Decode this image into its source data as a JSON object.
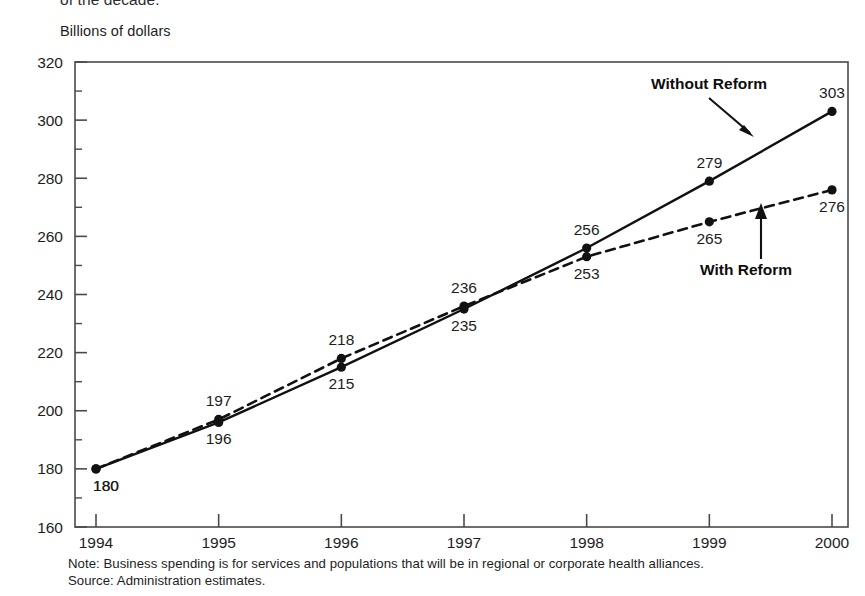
{
  "page": {
    "truncated_heading": "of the decade.",
    "axis_title": "Billions of dollars"
  },
  "footnotes": {
    "note": "Note: Business spending is for services and populations that will be in regional or corporate health alliances.",
    "source": "Source: Administration estimates."
  },
  "annotations": {
    "without_reform_label": "Without Reform",
    "with_reform_label": "With Reform"
  },
  "chart_data": {
    "type": "line",
    "title": "",
    "subtitle": "",
    "xlabel": "",
    "ylabel": "Billions of dollars",
    "categories": [
      "1994",
      "1995",
      "1996",
      "1997",
      "1998",
      "1999",
      "2000"
    ],
    "x": [
      1994,
      1995,
      1996,
      1997,
      1998,
      1999,
      2000
    ],
    "ylim": [
      160,
      320
    ],
    "ytick_labels": [
      "160",
      "180",
      "200",
      "220",
      "240",
      "260",
      "280",
      "300",
      "320"
    ],
    "yticks": [
      160,
      180,
      200,
      220,
      240,
      260,
      280,
      300,
      320
    ],
    "minor_tick_step": 10,
    "grid": false,
    "legend_position": "inline-annotations",
    "series": [
      {
        "name": "Without Reform",
        "style": "solid",
        "marker": "filled-circle",
        "values": [
          180,
          196,
          215,
          235,
          256,
          279,
          303
        ],
        "labels": [
          "180",
          "196",
          "215",
          "235",
          "256",
          "279",
          "303"
        ],
        "label_positions": [
          "below",
          "below",
          "below",
          "below",
          "above",
          "above",
          "above"
        ]
      },
      {
        "name": "With Reform",
        "style": "dashed",
        "marker": "filled-circle",
        "values": [
          180,
          197,
          218,
          236,
          253,
          265,
          276
        ],
        "labels": [
          "180",
          "197",
          "218",
          "236",
          "253",
          "265",
          "276"
        ],
        "label_positions": [
          "below",
          "above",
          "above",
          "above",
          "below",
          "below",
          "below"
        ]
      }
    ],
    "shared_first_point": {
      "year": 1994,
      "value": 180,
      "label": "180"
    }
  }
}
